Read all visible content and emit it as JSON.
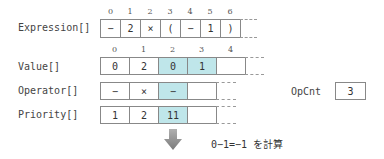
{
  "expression": {
    "label": "Expression[]",
    "indices": [
      "0",
      "1",
      "2",
      "3",
      "4",
      "5",
      "6"
    ],
    "cells": [
      "−",
      "2",
      "×",
      "(",
      "−",
      "1",
      ")"
    ]
  },
  "value": {
    "label": "Value[]",
    "indices": [
      "0",
      "1",
      "2",
      "3",
      "4"
    ],
    "cells": [
      "0",
      "2",
      "0",
      "1",
      ""
    ],
    "highlighted": [
      2,
      3
    ]
  },
  "operator": {
    "label": "Operator[]",
    "cells": [
      "−",
      "×",
      "−",
      ""
    ],
    "highlighted": [
      2
    ]
  },
  "priority": {
    "label": "Priority[]",
    "cells": [
      "1",
      "2",
      "11",
      ""
    ],
    "highlighted": [
      2
    ]
  },
  "opcnt": {
    "label": "OpCnt",
    "value": "3"
  },
  "result": {
    "text": "0−1=−1 を計算"
  },
  "colors": {
    "highlight": "#bfe6ea",
    "border": "#888888",
    "arrow": "#8c8c8c"
  }
}
